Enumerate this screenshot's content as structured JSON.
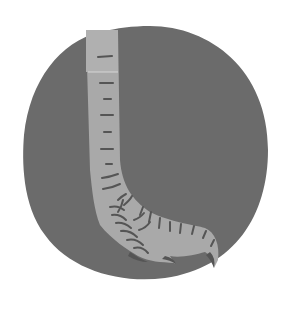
{
  "image": {
    "subject": "bird foot illustration",
    "width": 291,
    "height": 309
  },
  "colors": {
    "background": "#ffffff",
    "circle": "#6b6b6b",
    "foot": "#a9a9a9",
    "scales": "#555555"
  }
}
